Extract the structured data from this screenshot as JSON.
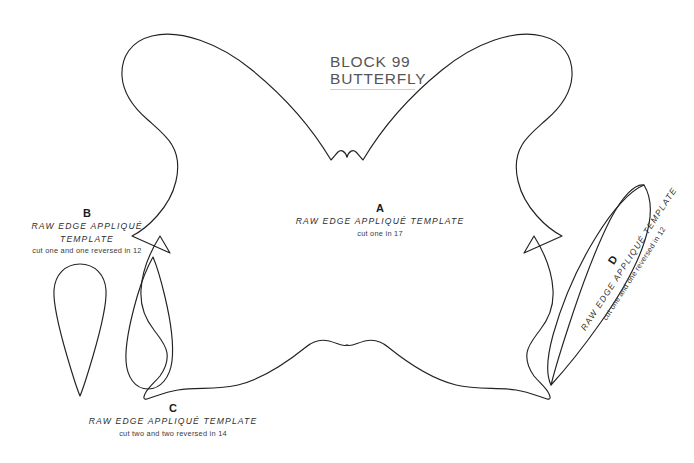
{
  "page": {
    "background_color": "#ffffff",
    "line_color": "#222222",
    "title_color": "#555557",
    "rule_color": "#cfcfcf"
  },
  "header": {
    "line1": "BLOCK 99",
    "line2": "BUTTERFLY"
  },
  "templates": [
    {
      "id": "a",
      "letter": "A",
      "main_text": "RAW EDGE APPLIQUÉ TEMPLATE",
      "sub_text": "cut one in 17",
      "shape": "butterfly"
    },
    {
      "id": "b",
      "letter": "B",
      "main_text": "RAW EDGE APPLIQUÉ TEMPLATE",
      "sub_text": "cut one and one reversed in 12",
      "shape": "teardrop-point-down"
    },
    {
      "id": "c",
      "letter": "C",
      "main_text": "RAW EDGE APPLIQUÉ TEMPLATE",
      "sub_text": "cut two and two reversed in 14",
      "shape": "teardrop-point-up"
    },
    {
      "id": "d",
      "letter": "D",
      "main_text": "RAW EDGE APPLIQUÉ TEMPLATE",
      "sub_text": "cut one and one reversed in 12",
      "shape": "curved-teardrop"
    }
  ]
}
